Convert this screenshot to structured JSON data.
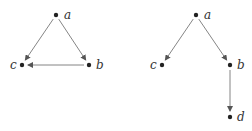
{
  "graphs": [
    {
      "name": "left-graph",
      "nodes": [
        {
          "id": "a",
          "label": "a",
          "x": 56,
          "y": 15,
          "lx": 64,
          "ly": 19
        },
        {
          "id": "b",
          "label": "b",
          "x": 89,
          "y": 65,
          "lx": 96,
          "ly": 69
        },
        {
          "id": "c",
          "label": "c",
          "x": 22,
          "y": 65,
          "lx": 10,
          "ly": 69
        }
      ],
      "edges": [
        {
          "from": "a",
          "to": "c"
        },
        {
          "from": "a",
          "to": "b"
        },
        {
          "from": "b",
          "to": "c"
        }
      ]
    },
    {
      "name": "right-graph",
      "nodes": [
        {
          "id": "a",
          "label": "a",
          "x": 196,
          "y": 15,
          "lx": 204,
          "ly": 19
        },
        {
          "id": "c",
          "label": "c",
          "x": 162,
          "y": 65,
          "lx": 150,
          "ly": 69
        },
        {
          "id": "b",
          "label": "b",
          "x": 230,
          "y": 65,
          "lx": 237,
          "ly": 69
        },
        {
          "id": "d",
          "label": "d",
          "x": 230,
          "y": 117,
          "lx": 237,
          "ly": 121
        }
      ],
      "edges": [
        {
          "from": "a",
          "to": "c"
        },
        {
          "from": "a",
          "to": "b"
        },
        {
          "from": "b",
          "to": "d"
        }
      ]
    }
  ],
  "colors": {
    "edge": "#666666",
    "node": "#222222",
    "label": "#333333"
  }
}
